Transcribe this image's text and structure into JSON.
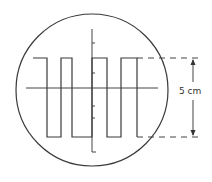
{
  "diagram": {
    "screen": {
      "shape": "circle"
    },
    "waveform": {
      "type": "square",
      "cycles_visible": 4,
      "peak_to_peak_label": "5 cm"
    },
    "axes": {
      "vertical_ticks_per_half": 3
    },
    "annotation": {
      "measurement": "5 cm",
      "arrow": "double-headed vertical"
    },
    "colors": {
      "line": "#3a3a3a",
      "background": "#ffffff"
    }
  }
}
